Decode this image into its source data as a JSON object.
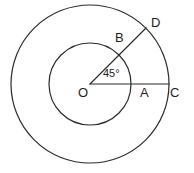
{
  "figure": {
    "kind": "concentric-circles-angle-diagram",
    "width": 194,
    "height": 173,
    "background_color": "#ffffff",
    "stroke_color": "#2b2b2b",
    "text_color": "#1d1d1d"
  },
  "geometry": {
    "center": {
      "x": 90,
      "y": 84,
      "label": "O"
    },
    "circles": [
      {
        "name": "inner-circle",
        "cx": 90,
        "cy": 84,
        "r": 41
      },
      {
        "name": "outer-circle",
        "cx": 90,
        "cy": 84,
        "r": 79
      }
    ],
    "segments": [
      {
        "name": "segment-OC",
        "x1": 90,
        "y1": 84,
        "x2": 169,
        "y2": 84
      },
      {
        "name": "segment-OD",
        "x1": 90,
        "y1": 84,
        "x2": 146,
        "y2": 28
      }
    ],
    "angle": {
      "vertex": "O",
      "between": [
        "OC",
        "OD"
      ],
      "value": "45°",
      "arc_radius": 19
    }
  },
  "labels": {
    "center": "O",
    "inner_on_horizontal": "A",
    "outer_on_horizontal": "C",
    "inner_on_ray": "B",
    "outer_on_ray": "D",
    "angle_measure": "45°"
  }
}
